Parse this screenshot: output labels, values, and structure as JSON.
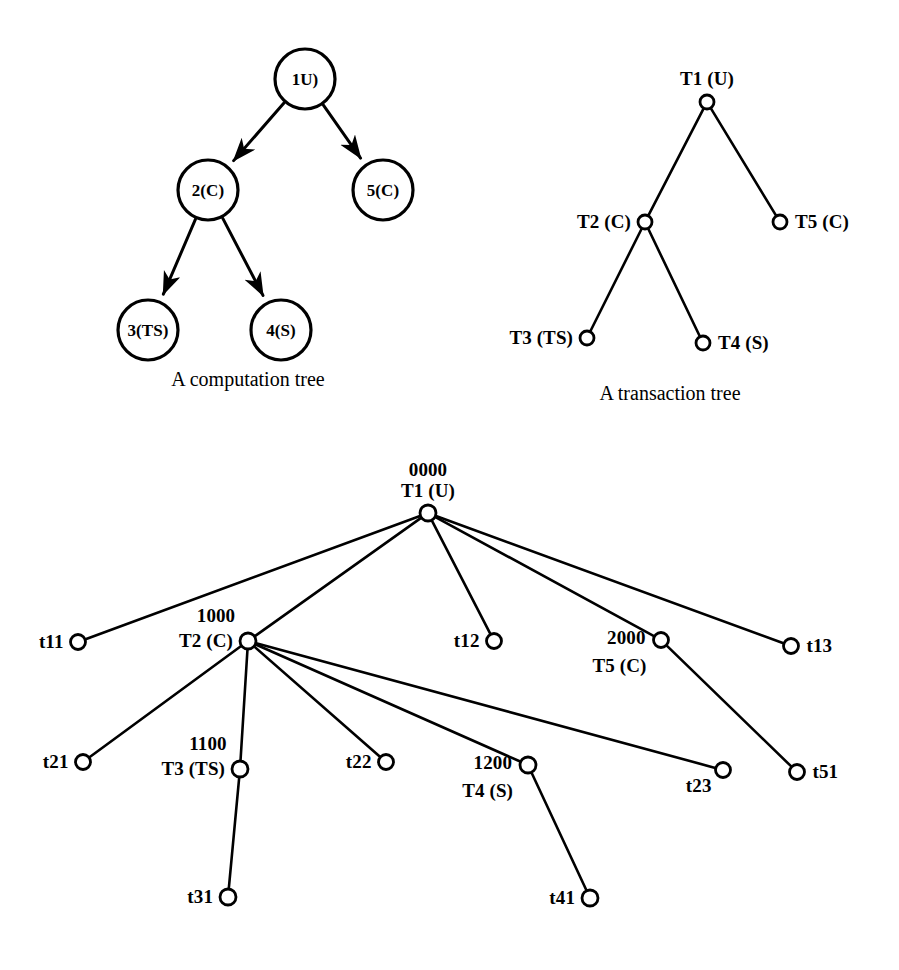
{
  "figure": {
    "background": "#ffffff",
    "ink": "#000000",
    "panels": [
      {
        "id": "computation-tree",
        "caption": "A computation tree",
        "caption_pos": [
          248,
          368
        ],
        "node_style": "filled-circle-outline",
        "nodes": [
          {
            "id": "c1",
            "label": "1(U)",
            "display": "1U)",
            "cx": 305,
            "cy": 79,
            "r": 30
          },
          {
            "id": "c2",
            "label": "2(C)",
            "display": "2(C)",
            "cx": 208,
            "cy": 190,
            "r": 30
          },
          {
            "id": "c5",
            "label": "5(C)",
            "display": "5(C)",
            "cx": 383,
            "cy": 190,
            "r": 30
          },
          {
            "id": "c3",
            "label": "3(TS)",
            "display": "3(TS)",
            "cx": 148,
            "cy": 330,
            "r": 30
          },
          {
            "id": "c4",
            "label": "4(S)",
            "display": "4(S)",
            "cx": 281,
            "cy": 330,
            "r": 30
          }
        ],
        "edges": [
          {
            "from": "c1",
            "to": "c2",
            "arrow": true
          },
          {
            "from": "c1",
            "to": "c5",
            "arrow": true
          },
          {
            "from": "c2",
            "to": "c3",
            "arrow": true
          },
          {
            "from": "c2",
            "to": "c4",
            "arrow": true
          }
        ]
      },
      {
        "id": "transaction-tree",
        "caption": "A transaction tree",
        "caption_pos": [
          670,
          382
        ],
        "node_style": "hollow-circle",
        "nodes": [
          {
            "id": "t1",
            "label": "T1 (U)",
            "cx": 707,
            "cy": 102,
            "r": 7,
            "label_pos": "above"
          },
          {
            "id": "t2",
            "label": "T2 (C)",
            "cx": 645,
            "cy": 222,
            "r": 7,
            "label_pos": "left"
          },
          {
            "id": "t5",
            "label": "T5 (C)",
            "cx": 780,
            "cy": 222,
            "r": 7,
            "label_pos": "right"
          },
          {
            "id": "t3",
            "label": "T3 (TS)",
            "cx": 587,
            "cy": 338,
            "r": 7,
            "label_pos": "left"
          },
          {
            "id": "t4",
            "label": "T4 (S)",
            "cx": 703,
            "cy": 343,
            "r": 7,
            "label_pos": "right"
          }
        ],
        "edges": [
          {
            "from": "t1",
            "to": "t2"
          },
          {
            "from": "t1",
            "to": "t5"
          },
          {
            "from": "t2",
            "to": "t3"
          },
          {
            "from": "t2",
            "to": "t4"
          }
        ]
      },
      {
        "id": "labelled-transaction-tree",
        "caption": "",
        "node_style": "hollow-circle",
        "nodes": [
          {
            "id": "b_t1",
            "label": "T1 (U)",
            "tag": "0000",
            "cx": 428,
            "cy": 513,
            "r": 8,
            "label_pos": "above-stacked"
          },
          {
            "id": "b_t11",
            "label": "t11",
            "tag": "",
            "cx": 78,
            "cy": 642,
            "r": 7.5,
            "label_pos": "left"
          },
          {
            "id": "b_t2",
            "label": "T2 (C)",
            "tag": "1000",
            "cx": 248,
            "cy": 641,
            "r": 8,
            "label_pos": "left-stacked"
          },
          {
            "id": "b_t12",
            "label": "t12",
            "tag": "",
            "cx": 494,
            "cy": 641,
            "r": 7.5,
            "label_pos": "left"
          },
          {
            "id": "b_t5",
            "label": "T5 (C)",
            "tag": "2000",
            "cx": 661,
            "cy": 640,
            "r": 7.5,
            "label_pos": "left-stacked-below"
          },
          {
            "id": "b_t13",
            "label": "t13",
            "tag": "",
            "cx": 791,
            "cy": 646,
            "r": 7.5,
            "label_pos": "right"
          },
          {
            "id": "b_t21",
            "label": "t21",
            "tag": "",
            "cx": 83,
            "cy": 762,
            "r": 7.5,
            "label_pos": "left"
          },
          {
            "id": "b_t3",
            "label": "T3 (TS)",
            "tag": "1100",
            "cx": 240,
            "cy": 769,
            "r": 8,
            "label_pos": "left-stacked"
          },
          {
            "id": "b_t22",
            "label": "t22",
            "tag": "",
            "cx": 386,
            "cy": 762,
            "r": 7.5,
            "label_pos": "left"
          },
          {
            "id": "b_t4",
            "label": "T4 (S)",
            "tag": "1200",
            "cx": 528,
            "cy": 765,
            "r": 8,
            "label_pos": "left-stacked-below"
          },
          {
            "id": "b_t23",
            "label": "t23",
            "tag": "",
            "cx": 723,
            "cy": 770,
            "r": 7.5,
            "label_pos": "below-left"
          },
          {
            "id": "b_t51",
            "label": "t51",
            "tag": "",
            "cx": 797,
            "cy": 772,
            "r": 7.5,
            "label_pos": "right"
          },
          {
            "id": "b_t31",
            "label": "t31",
            "tag": "",
            "cx": 228,
            "cy": 897,
            "r": 8,
            "label_pos": "left"
          },
          {
            "id": "b_t41",
            "label": "t41",
            "tag": "",
            "cx": 590,
            "cy": 898,
            "r": 8,
            "label_pos": "left"
          }
        ],
        "edges": [
          {
            "from": "b_t1",
            "to": "b_t11"
          },
          {
            "from": "b_t1",
            "to": "b_t2"
          },
          {
            "from": "b_t1",
            "to": "b_t12"
          },
          {
            "from": "b_t1",
            "to": "b_t5"
          },
          {
            "from": "b_t1",
            "to": "b_t13"
          },
          {
            "from": "b_t2",
            "to": "b_t21"
          },
          {
            "from": "b_t2",
            "to": "b_t3"
          },
          {
            "from": "b_t2",
            "to": "b_t22"
          },
          {
            "from": "b_t2",
            "to": "b_t4"
          },
          {
            "from": "b_t2",
            "to": "b_t23"
          },
          {
            "from": "b_t5",
            "to": "b_t51"
          },
          {
            "from": "b_t3",
            "to": "b_t31"
          },
          {
            "from": "b_t4",
            "to": "b_t41"
          }
        ]
      }
    ]
  }
}
